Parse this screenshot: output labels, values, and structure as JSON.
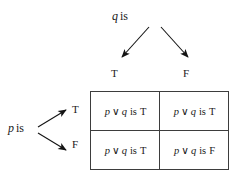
{
  "diagram": {
    "title_top_operand": {
      "var": "q",
      "verb": "is"
    },
    "title_left_operand": {
      "var": "p",
      "verb": "is"
    },
    "column_headers": [
      "T",
      "F"
    ],
    "row_headers": [
      "T",
      "F"
    ],
    "expression": {
      "left": "p",
      "operator": "∨",
      "right": "q",
      "verb": "is"
    },
    "cells": [
      [
        {
          "expr_left": "p",
          "expr_op": "∨",
          "expr_right": "q",
          "verb": "is",
          "value": "T"
        },
        {
          "expr_left": "p",
          "expr_op": "∨",
          "expr_right": "q",
          "verb": "is",
          "value": "T"
        }
      ],
      [
        {
          "expr_left": "p",
          "expr_op": "∨",
          "expr_right": "q",
          "verb": "is",
          "value": "T"
        },
        {
          "expr_left": "p",
          "expr_op": "∨",
          "expr_right": "q",
          "verb": "is",
          "value": "F"
        }
      ]
    ],
    "colors": {
      "ink": "#1a1a1a",
      "border": "#3d3d3d",
      "background": "#ffffff"
    }
  }
}
